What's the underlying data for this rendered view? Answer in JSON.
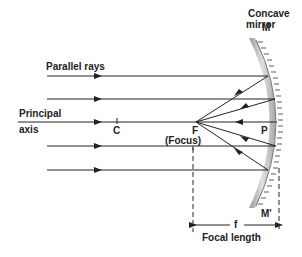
{
  "diagram": {
    "labels": {
      "mirror_line1": "Concave",
      "mirror_line2": "mirror",
      "M_top": "M",
      "M_bottom": "M'",
      "parallel_rays": "Parallel rays",
      "principal_line1": "Principal",
      "principal_line2": "axis",
      "C": "C",
      "F": "F",
      "focus": "(Focus)",
      "P": "P",
      "f": "f",
      "focal_length": "Focal length"
    },
    "colors": {
      "line": "#222222",
      "mirror": "#bdbdbd"
    }
  }
}
